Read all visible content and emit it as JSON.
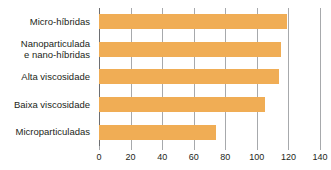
{
  "chart_data": {
    "type": "bar",
    "orientation": "horizontal",
    "title": "",
    "xlabel": "",
    "ylabel": "",
    "categories": [
      "Micro-híbridas",
      "Nanoparticulada\ne nano-híbridas",
      "Alta viscosidade",
      "Baixa viscosidade",
      "Microparticuladas"
    ],
    "values": [
      119,
      115,
      114,
      105,
      74
    ],
    "xlim": [
      0,
      140
    ],
    "xticks": [
      0,
      20,
      40,
      60,
      80,
      100,
      120,
      140
    ],
    "xtick_labels": [
      "0",
      "20",
      "40",
      "60",
      "80",
      "100",
      "120",
      "140"
    ],
    "grid": true,
    "grid_axis": "x",
    "legend": false,
    "bar_color": "#f0ad55",
    "gridline_color": "#a7a9ac",
    "axis_color": "#6d6e71",
    "background_color": "#ffffff",
    "text_color": "#231f20"
  }
}
